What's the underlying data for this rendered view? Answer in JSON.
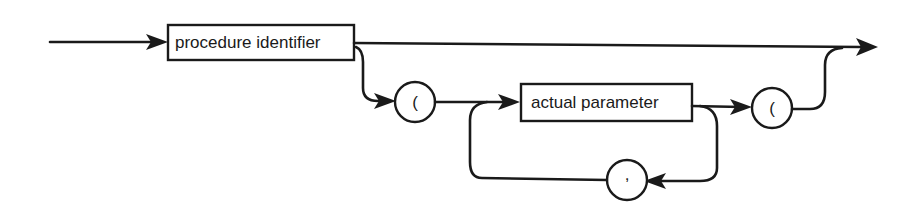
{
  "diagram": {
    "type": "syntax-diagram",
    "nonterminals": [
      {
        "id": "procedure_identifier",
        "label": "procedure identifier"
      },
      {
        "id": "actual_parameter",
        "label": "actual parameter"
      }
    ],
    "terminals": [
      {
        "id": "open_paren",
        "symbol": "("
      },
      {
        "id": "close_paren",
        "symbol": "("
      },
      {
        "id": "comma",
        "symbol": ","
      }
    ],
    "colors": {
      "ink": "#1a1a1a",
      "background": "#ffffff"
    }
  }
}
